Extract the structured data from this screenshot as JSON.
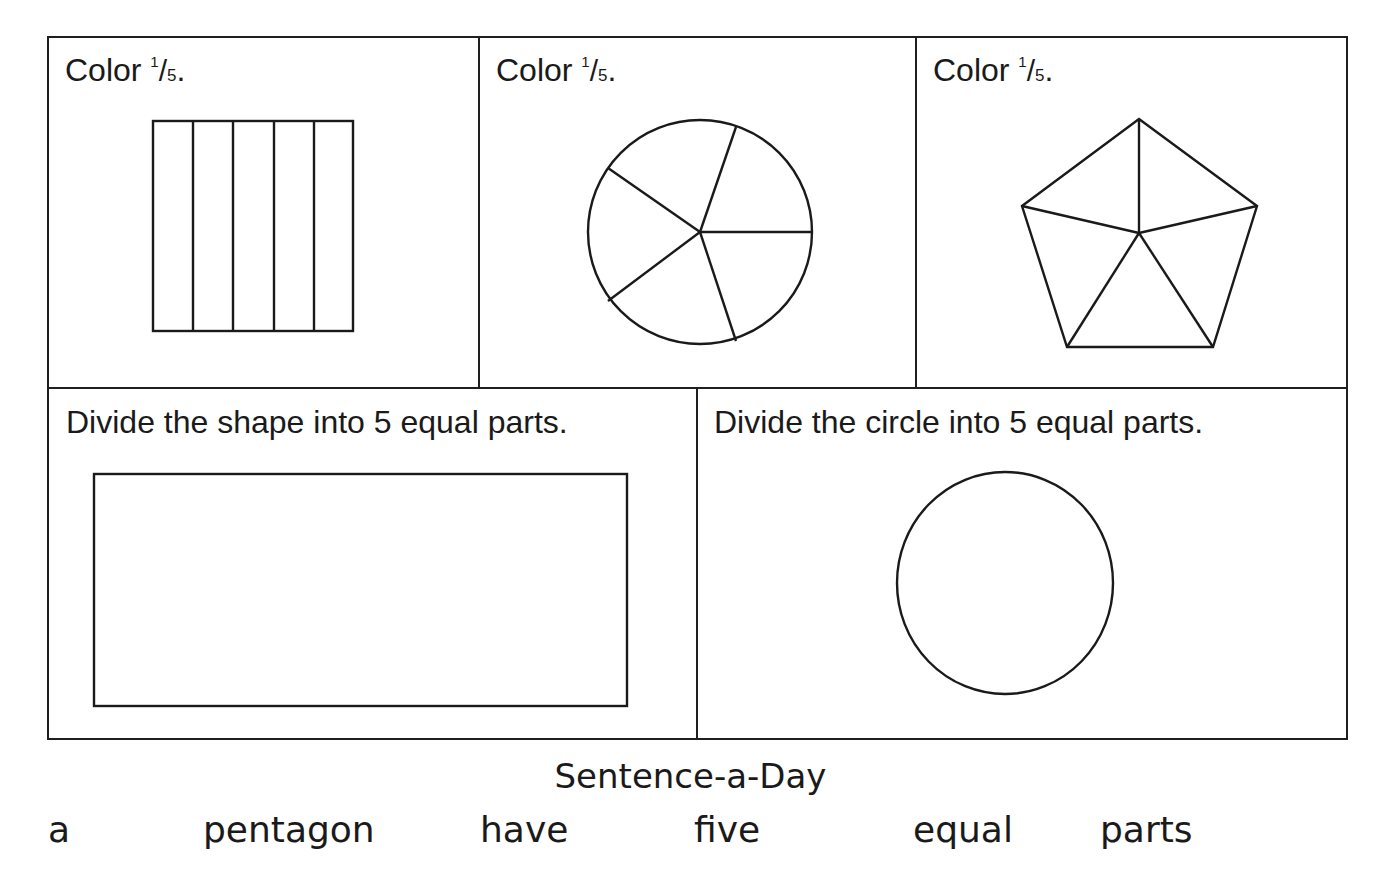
{
  "worksheet": {
    "top_row": [
      {
        "prompt": "Color",
        "fraction_numerator": "1",
        "fraction_slash": "/",
        "fraction_denominator": "5",
        "end": ".",
        "shape": "rectangle-5-vertical-strips"
      },
      {
        "prompt": "Color",
        "fraction_numerator": "1",
        "fraction_slash": "/",
        "fraction_denominator": "5",
        "end": ".",
        "shape": "circle-5-sectors"
      },
      {
        "prompt": "Color",
        "fraction_numerator": "1",
        "fraction_slash": "/",
        "fraction_denominator": "5",
        "end": ".",
        "shape": "pentagon-5-triangles"
      }
    ],
    "bottom_row": [
      {
        "prompt": "Divide the shape into 5 equal parts.",
        "shape": "blank-rectangle"
      },
      {
        "prompt": "Divide the circle into 5 equal parts.",
        "shape": "blank-circle"
      }
    ]
  },
  "sentence_a_day": {
    "title": "Sentence-a-Day",
    "words": [
      "a",
      "pentagon",
      "have",
      "five",
      "equal",
      "parts"
    ]
  },
  "colors": {
    "ink": "#1a1a1a",
    "paper": "#ffffff"
  }
}
